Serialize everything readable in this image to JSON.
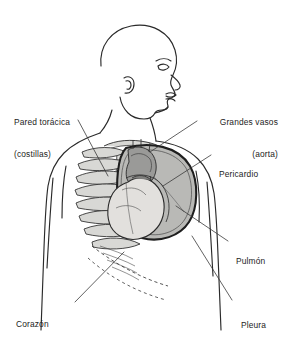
{
  "figure": {
    "background_color": "#ffffff",
    "ink_color": "#1c1c1c",
    "labels": [
      {
        "id": "pared-toracica",
        "line1": "Pared torácica",
        "line2": "(costillas)"
      },
      {
        "id": "grandes-vasos",
        "line1": "Grandes vasos",
        "line2": "(aorta)"
      },
      {
        "id": "pericardio",
        "line1": "Pericardio",
        "line2": ""
      },
      {
        "id": "pulmon",
        "line1": "Pulmón",
        "line2": ""
      },
      {
        "id": "corazon",
        "line1": "Corazón",
        "line2": ""
      },
      {
        "id": "pleura",
        "line1": "Pleura",
        "line2": ""
      }
    ],
    "colors": {
      "outline": "#2a2a2a",
      "lung_fill": "#b9b9b6",
      "lung_inner": "#c9c9c6",
      "heart_fill": "#e2e0dd",
      "vessel_fill": "#9a9a98",
      "rib_fill": "#d8d8d5",
      "pleura_line": "#1e1e1e",
      "leader_line": "#3a3a3a"
    },
    "parts": [
      "cabeza-perfil",
      "cuello",
      "hombro-izquierdo",
      "hombro-derecho",
      "torso",
      "caja-toracica",
      "esternon",
      "clavicula",
      "pulmon-derecho",
      "pleura-contorno",
      "corazon",
      "pericardio",
      "arco-aortico",
      "diafragma-discontinuo"
    ]
  }
}
